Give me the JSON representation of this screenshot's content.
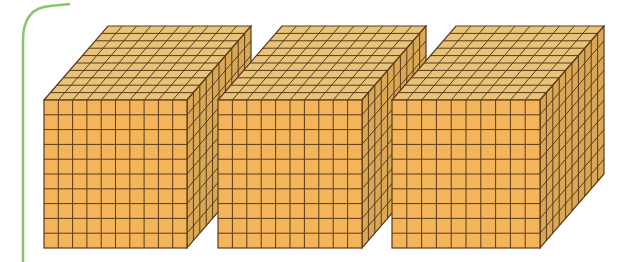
{
  "figure": {
    "cube_count": 3,
    "grid_divisions": 10,
    "colors": {
      "front_face": "#f4b45a",
      "top_face": "#e8c47a",
      "side_face": "#d9a856",
      "grid_line": "#5a3a1a",
      "frame_line": "#8cc46e",
      "background": "#ffffff"
    },
    "cubes": [
      {
        "front": [
          44,
          100,
          187,
          248
        ],
        "depth": [
          64,
          -74
        ]
      },
      {
        "front": [
          218,
          100,
          362,
          248
        ],
        "depth": [
          64,
          -74
        ]
      },
      {
        "front": [
          392,
          100,
          540,
          248
        ],
        "depth": [
          64,
          -74
        ]
      }
    ]
  }
}
